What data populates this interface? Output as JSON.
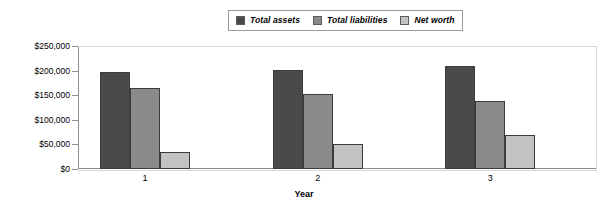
{
  "chart_data": {
    "type": "bar",
    "title": "",
    "xlabel": "Year",
    "ylabel": "",
    "categories": [
      "1",
      "2",
      "3"
    ],
    "series": [
      {
        "name": "Total assets",
        "values": [
          198000,
          202000,
          210000
        ],
        "color": "#4a4a4a"
      },
      {
        "name": "Total liabilities",
        "values": [
          165000,
          152000,
          138000
        ],
        "color": "#8a8a8a"
      },
      {
        "name": "Net worth",
        "values": [
          34000,
          50000,
          69000
        ],
        "color": "#c2c2c2"
      }
    ],
    "ylim": [
      0,
      250000
    ],
    "yticks": [
      0,
      50000,
      100000,
      150000,
      200000,
      250000
    ],
    "ytick_labels": [
      "$0",
      "$50,000",
      "$100,000",
      "$150,000",
      "$200,000",
      "$250,000"
    ],
    "grid": false,
    "legend_position": "top-center"
  },
  "legend": {
    "entries": [
      {
        "label": "Total assets"
      },
      {
        "label": "Total liabilities"
      },
      {
        "label": "Net worth"
      }
    ]
  },
  "axes": {
    "x_title": "Year"
  }
}
